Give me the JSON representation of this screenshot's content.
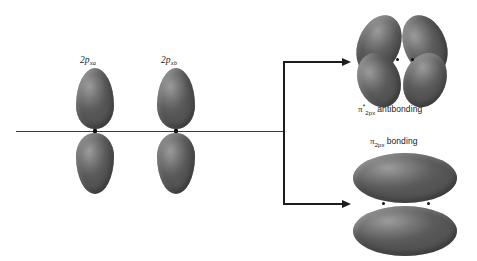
{
  "diagram": {
    "type": "orbital-combination-diagram",
    "background_color": "#ffffff",
    "orbital_color": "#787878",
    "line_color": "#1c1c1c"
  },
  "left": {
    "atomic_orbitals": [
      {
        "id": "orbital-a",
        "label_main": "2p",
        "label_sub": "xa",
        "center_x": 95,
        "center_y": 131,
        "lobes": 2,
        "shape": "teardrop-pair-vertical"
      },
      {
        "id": "orbital-b",
        "label_main": "2p",
        "label_sub": "xb",
        "center_x": 176,
        "center_y": 131,
        "lobes": 2,
        "shape": "teardrop-pair-vertical"
      }
    ],
    "axis": {
      "name": "internuclear-axis",
      "x_start": 16,
      "x_end": 283,
      "y": 131
    }
  },
  "connector": {
    "name": "combination-bracket",
    "split_y": 131,
    "upper_arrow_y": 62,
    "lower_arrow_y": 203,
    "stem_x": 283,
    "arrow_tip_x": 350
  },
  "right": {
    "molecular_orbitals": [
      {
        "id": "mo-antibonding",
        "pi": "π",
        "superscript": "*",
        "subscript": "2p",
        "subscript_tail": "x",
        "word": "antibonding",
        "lobes": 4,
        "shape": "four-lobe-cloverleaf",
        "center_x": 403,
        "center_y": 60,
        "label_x": 358,
        "label_y": 103
      },
      {
        "id": "mo-bonding",
        "pi": "π",
        "superscript": "",
        "subscript": "2p",
        "subscript_tail": "x",
        "word": "bonding",
        "lobes": 2,
        "shape": "two-ellipse-stacked",
        "center_x": 405,
        "center_y": 203,
        "label_x": 370,
        "label_y": 136
      }
    ]
  }
}
